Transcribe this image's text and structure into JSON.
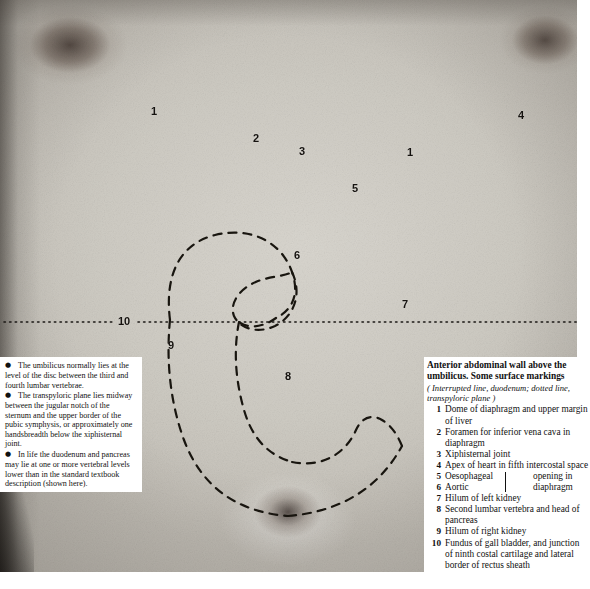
{
  "figure": {
    "alt_description": "Black and white photograph of a male anterior abdominal wall and lower chest, with numbered surface-marking labels, an interrupted (dashed) outline of the stomach and duodenum, and a dotted horizontal transpyloric plane line",
    "number_labels": [
      {
        "id": "1-left",
        "text": "1",
        "x": 151,
        "y": 106
      },
      {
        "id": "2",
        "text": "2",
        "x": 253,
        "y": 133
      },
      {
        "id": "3",
        "text": "3",
        "x": 299,
        "y": 146
      },
      {
        "id": "1-right",
        "text": "1",
        "x": 407,
        "y": 147
      },
      {
        "id": "4",
        "text": "4",
        "x": 518,
        "y": 110
      },
      {
        "id": "5",
        "text": "5",
        "x": 352,
        "y": 183
      },
      {
        "id": "6",
        "text": "6",
        "x": 294,
        "y": 250
      },
      {
        "id": "7",
        "text": "7",
        "x": 402,
        "y": 299
      },
      {
        "id": "10",
        "text": "10",
        "x": 120,
        "y": 317
      },
      {
        "id": "9",
        "text": "9",
        "x": 168,
        "y": 340
      },
      {
        "id": "8",
        "text": "8",
        "x": 285,
        "y": 371
      }
    ],
    "transpyloric_plane": {
      "style": "dotted",
      "y": 322,
      "x_start": 2,
      "x_end": 577
    },
    "duodenum_outline": {
      "style": "interrupted-dashed"
    }
  },
  "notes": {
    "bullets": [
      "The umbilicus normally lies at the level of the disc between the third and fourth lumbar vertebrae.",
      "The transpyloric plane lies midway between the jugular notch of the sternum and the upper border of the pubic symphysis, or approximately one handsbreadth below the xiphisternal joint.",
      "In life the duodenum and pancreas may lie at one or more vertebral levels lower than in the standard textbook description (shown here)."
    ],
    "bullet_glyph": "●"
  },
  "caption": {
    "title": "Anterior abdominal wall above the umbilicus. Some surface markings",
    "subtitle": "( Interrupted line, duodenum; dotted line, transpyloric plane )",
    "key": [
      {
        "num": "1",
        "text": "Dome of diaphragm and upper margin of liver"
      },
      {
        "num": "2",
        "text": "Foramen for inferior vena cava in diaphragm"
      },
      {
        "num": "3",
        "text": "Xiphisternal joint"
      },
      {
        "num": "4",
        "text": "Apex of heart in fifth intercostal space"
      },
      {
        "num": "7",
        "text": "Hilum of left kidney"
      },
      {
        "num": "8",
        "text": "Second lumbar vertebra and head of pancreas"
      },
      {
        "num": "9",
        "text": "Hilum of right kidney"
      },
      {
        "num": "10",
        "text": "Fundus of gall bladder, and junction of ninth costal cartilage and lateral border of rectus sheath"
      }
    ],
    "braced_pair": {
      "num_a": "5",
      "label_a": "Oesophageal",
      "num_b": "6",
      "label_b": "Aortic",
      "shared_line_1": "opening in",
      "shared_line_2": "diaphragm"
    }
  },
  "colors": {
    "ink": "#111111",
    "paper": "#ffffff",
    "skin_mid": "#cfccc4",
    "skin_light": "#d9d6cf",
    "skin_dark": "#c0bcb3"
  }
}
